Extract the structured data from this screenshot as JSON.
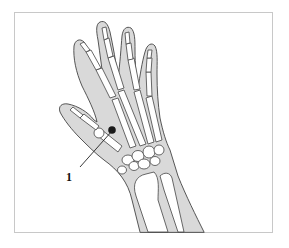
{
  "figure": {
    "type": "anatomical-illustration",
    "colors": {
      "skin_fill": "#d9d9d9",
      "outline": "#444444",
      "bone_fill": "#ffffff",
      "marker": "#1a1a1a",
      "frame_border": "#c8c8c8",
      "background": "#ffffff"
    },
    "markers": [
      {
        "id": "1",
        "label": "1",
        "position": "between thumb and index metacarpal, near carpals"
      }
    ]
  }
}
